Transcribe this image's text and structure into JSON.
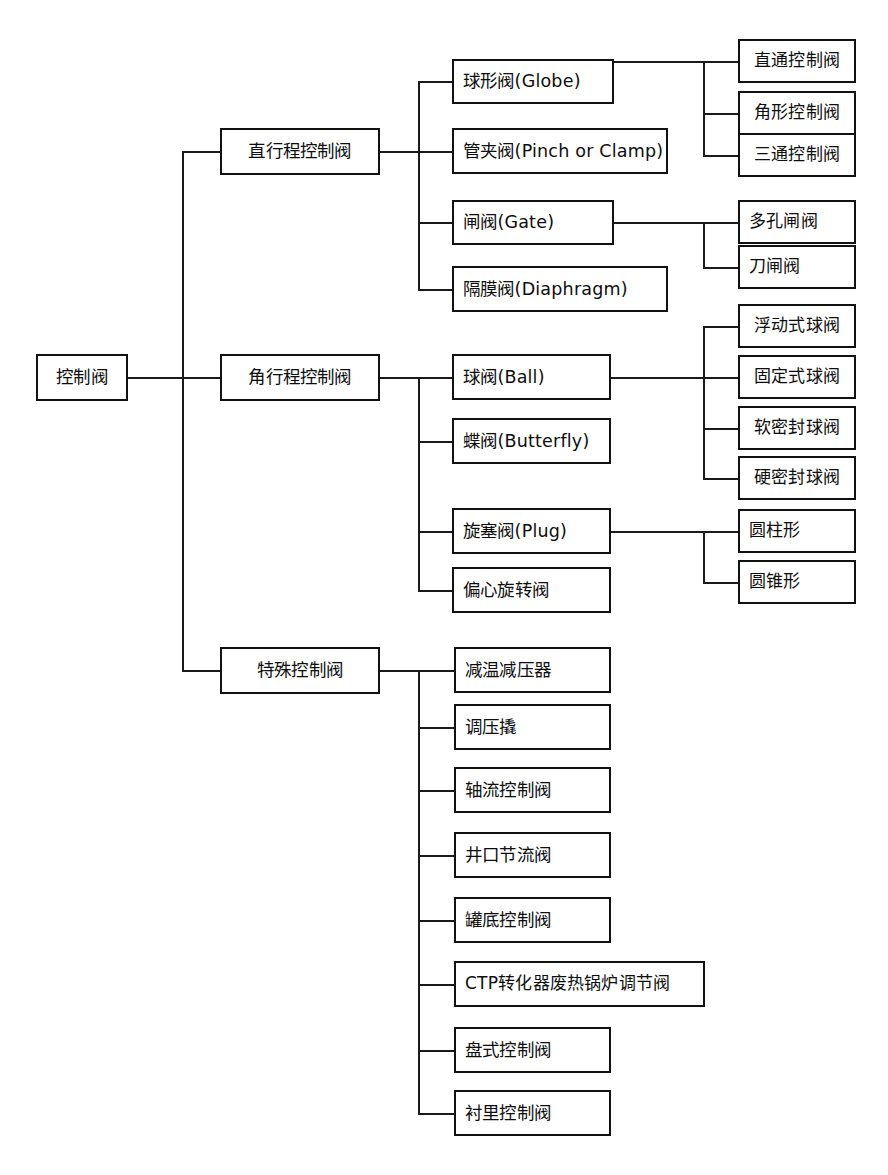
{
  "diagram": {
    "type": "tree",
    "orientation": "left-to-right",
    "root": {
      "label": "控制阀"
    },
    "level2": [
      {
        "label": "直行程控制阀"
      },
      {
        "label": "角行程控制阀"
      },
      {
        "label": "特殊控制阀"
      }
    ],
    "level3": {
      "straight_stroke": [
        {
          "label": "球形阀(Globe)"
        },
        {
          "label": "管夹阀(Pinch or Clamp)"
        },
        {
          "label": "闸阀(Gate)"
        },
        {
          "label": "隔膜阀(Diaphragm)"
        }
      ],
      "angle_stroke": [
        {
          "label": "球阀(Ball)"
        },
        {
          "label": "蝶阀(Butterfly)"
        },
        {
          "label": "旋塞阀(Plug)"
        },
        {
          "label": "偏心旋转阀"
        }
      ],
      "special": [
        {
          "label": "减温减压器"
        },
        {
          "label": "调压撬"
        },
        {
          "label": "轴流控制阀"
        },
        {
          "label": "井口节流阀"
        },
        {
          "label": "罐底控制阀"
        },
        {
          "label": "CTP转化器废热锅炉调节阀"
        },
        {
          "label": "盘式控制阀"
        },
        {
          "label": "衬里控制阀"
        }
      ]
    },
    "level4": {
      "globe": [
        {
          "label": "直通控制阀"
        },
        {
          "label": "角形控制阀"
        },
        {
          "label": "三通控制阀"
        }
      ],
      "gate": [
        {
          "label": "多孔闸阀"
        },
        {
          "label": "刀闸阀"
        }
      ],
      "ball": [
        {
          "label": "浮动式球阀"
        },
        {
          "label": "固定式球阀"
        },
        {
          "label": "软密封球阀"
        },
        {
          "label": "硬密封球阀"
        }
      ],
      "plug": [
        {
          "label": "圆柱形"
        },
        {
          "label": "圆锥形"
        }
      ]
    },
    "colors": {
      "line": "#1a1a1a",
      "border": "#111111",
      "text": "#0d0d0d",
      "background": "#ffffff"
    }
  }
}
